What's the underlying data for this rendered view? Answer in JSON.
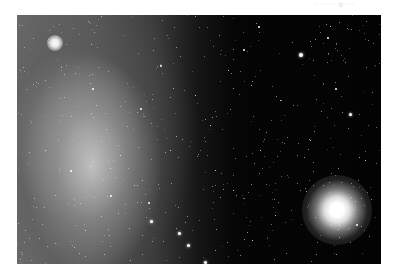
{
  "caption": "·· ······ ·g·····",
  "image": {
    "subject": "star field with dwarf galaxy and globular cluster",
    "colors": {
      "background": "#030303",
      "glow": "#d0d0d0",
      "frame": "#ffffff"
    }
  },
  "stars": [
    {
      "x": 299,
      "y": 53,
      "s": 4
    },
    {
      "x": 349,
      "y": 113,
      "s": 3
    },
    {
      "x": 335,
      "y": 88,
      "s": 2
    },
    {
      "x": 150,
      "y": 220,
      "s": 3
    },
    {
      "x": 178,
      "y": 232,
      "s": 3
    },
    {
      "x": 187,
      "y": 244,
      "s": 3
    },
    {
      "x": 204,
      "y": 261,
      "s": 3
    },
    {
      "x": 148,
      "y": 202,
      "s": 2
    },
    {
      "x": 140,
      "y": 108,
      "s": 2
    },
    {
      "x": 160,
      "y": 65,
      "s": 2
    },
    {
      "x": 243,
      "y": 49,
      "s": 2
    },
    {
      "x": 258,
      "y": 26,
      "s": 2
    },
    {
      "x": 327,
      "y": 37,
      "s": 2
    },
    {
      "x": 330,
      "y": 26,
      "s": 1
    },
    {
      "x": 228,
      "y": 70,
      "s": 1
    },
    {
      "x": 210,
      "y": 125,
      "s": 1
    },
    {
      "x": 260,
      "y": 150,
      "s": 1
    },
    {
      "x": 233,
      "y": 190,
      "s": 1
    },
    {
      "x": 275,
      "y": 215,
      "s": 1
    },
    {
      "x": 252,
      "y": 240,
      "s": 1
    },
    {
      "x": 356,
      "y": 224,
      "s": 2
    },
    {
      "x": 365,
      "y": 160,
      "s": 1
    },
    {
      "x": 310,
      "y": 140,
      "s": 1
    },
    {
      "x": 92,
      "y": 88,
      "s": 2
    },
    {
      "x": 70,
      "y": 170,
      "s": 2
    },
    {
      "x": 110,
      "y": 195,
      "s": 2
    },
    {
      "x": 45,
      "y": 150,
      "s": 1
    },
    {
      "x": 120,
      "y": 155,
      "s": 1
    },
    {
      "x": 85,
      "y": 230,
      "s": 1
    },
    {
      "x": 195,
      "y": 95,
      "s": 1
    },
    {
      "x": 280,
      "y": 100,
      "s": 1
    },
    {
      "x": 215,
      "y": 170,
      "s": 1
    },
    {
      "x": 170,
      "y": 150,
      "s": 1
    }
  ]
}
